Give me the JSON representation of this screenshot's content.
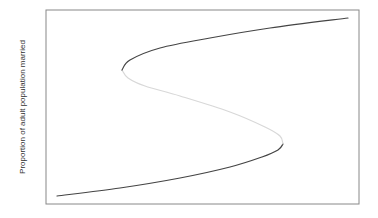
{
  "chart_data": {
    "type": "line",
    "title": "",
    "xlabel": "",
    "ylabel": "Proportion of adult population married",
    "grid": false,
    "legend": null,
    "series": [
      {
        "name": "lower stable branch",
        "color": "#444444",
        "points_px": [
          [
            57,
            196
          ],
          [
            120,
            188
          ],
          [
            180,
            178
          ],
          [
            230,
            167
          ],
          [
            262,
            157
          ],
          [
            278,
            150
          ],
          [
            283,
            144
          ]
        ]
      },
      {
        "name": "unstable middle branch",
        "color": "#d8d8d8",
        "points_px": [
          [
            283,
            144
          ],
          [
            280,
            136
          ],
          [
            265,
            127
          ],
          [
            230,
            112
          ],
          [
            180,
            96
          ],
          [
            145,
            86
          ],
          [
            128,
            78
          ],
          [
            122,
            70
          ]
        ]
      },
      {
        "name": "upper stable branch",
        "color": "#444444",
        "points_px": [
          [
            122,
            70
          ],
          [
            130,
            60
          ],
          [
            160,
            48
          ],
          [
            210,
            38
          ],
          [
            270,
            28
          ],
          [
            348,
            18
          ]
        ]
      }
    ],
    "frame_px": {
      "left": 46,
      "top": 10,
      "right": 359,
      "bottom": 204
    },
    "colors": {
      "frame": "#888888",
      "stable": "#444444",
      "unstable": "#d8d8d8"
    }
  }
}
